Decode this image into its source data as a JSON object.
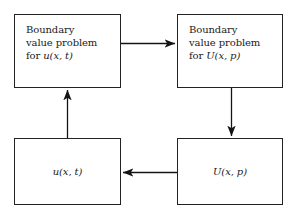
{
  "diagram": {
    "background_color": "#ffffff",
    "stroke_color": "#222222",
    "text_color": "#1a1a1a",
    "boxes": [
      {
        "id": "bvp-original",
        "lines": [
          "Boundary",
          "value problem",
          "for u(x,t)"
        ],
        "line1": "Boundary",
        "line2": "value problem",
        "line3_prefix": "for ",
        "line3_math": "u(x, t)",
        "x": 14,
        "y": 14,
        "width": 107,
        "height": 74
      },
      {
        "id": "bvp-transformed",
        "lines": [
          "Boundary",
          "value problem",
          "for U(x,p)"
        ],
        "line1": "Boundary",
        "line2": "value problem",
        "line3_prefix": "for ",
        "line3_math": "U(x, p)",
        "x": 177,
        "y": 14,
        "width": 106,
        "height": 74
      },
      {
        "id": "solution-original",
        "label_math": "u(x, t)",
        "x": 14,
        "y": 138,
        "width": 107,
        "height": 67
      },
      {
        "id": "solution-transformed",
        "label_math": "U(x, p)",
        "x": 177,
        "y": 138,
        "width": 106,
        "height": 67
      }
    ],
    "arrows": [
      {
        "id": "transform-arrow",
        "direction": "right",
        "from": "bvp-original",
        "to": "bvp-transformed",
        "x1": 121,
        "y1": 43,
        "x2": 177,
        "y2": 43
      },
      {
        "id": "solve-arrow",
        "direction": "down",
        "from": "bvp-transformed",
        "to": "solution-transformed",
        "x1": 231,
        "y1": 88,
        "x2": 231,
        "y2": 138
      },
      {
        "id": "invert-arrow",
        "direction": "left",
        "from": "solution-transformed",
        "to": "solution-original",
        "x1": 177,
        "y1": 172,
        "x2": 121,
        "y2": 172
      },
      {
        "id": "result-arrow",
        "direction": "up",
        "from": "solution-original",
        "to": "bvp-original",
        "x1": 67,
        "y1": 138,
        "x2": 67,
        "y2": 88
      }
    ]
  }
}
